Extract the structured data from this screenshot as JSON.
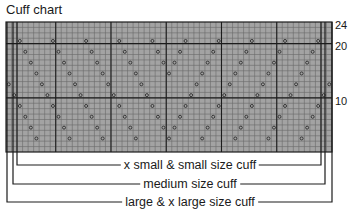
{
  "title": "Cuff chart",
  "colors": {
    "grid_fill": "#a3a3a3",
    "grid_line": "#6a6a6a",
    "heavy_line": "#1c1c1c",
    "symbol": "#2a2a2a"
  },
  "grid": {
    "columns": 59,
    "rows": 24,
    "heavy_every": 10,
    "heavy_col_boundaries": [
      9,
      19,
      29,
      39,
      49
    ],
    "heavy_row_boundaries_from_bottom": [
      10,
      20
    ]
  },
  "row_labels": [
    {
      "row": 24,
      "text": "24"
    },
    {
      "row": 20,
      "text": "20"
    },
    {
      "row": 10,
      "text": "10"
    }
  ],
  "symbols": {
    "name": "yarn-over",
    "glyph": "o",
    "rows_from_bottom": [
      21,
      19,
      17,
      15,
      13,
      11,
      9,
      7,
      5,
      3
    ],
    "repeat_width": 6,
    "left_start_col": 2,
    "mirror_col": 29,
    "shift_per_symbol_row": 1
  },
  "size_brackets": [
    {
      "label": "x small & small size cuff",
      "left_x": 17,
      "right_x": 321,
      "y": 165
    },
    {
      "label": "medium size cuff",
      "left_x": 13,
      "right_x": 325,
      "y": 184
    },
    {
      "label": "large & x large size cuff",
      "left_x": 7,
      "right_x": 332,
      "y": 202
    }
  ]
}
